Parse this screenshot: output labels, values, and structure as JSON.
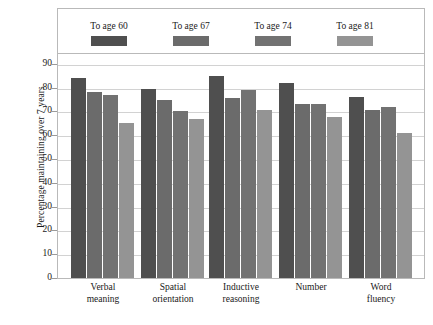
{
  "chart_data": {
    "type": "bar",
    "title": "",
    "xlabel": "",
    "ylabel": "Percentage maintaining over 7 years",
    "ylim": [
      0,
      95
    ],
    "ytick_max_label": 90,
    "yticks": [
      0,
      10,
      20,
      30,
      40,
      50,
      60,
      70,
      80,
      90
    ],
    "grid": true,
    "legend_position": "top-inside",
    "categories": [
      "Verbal\nmeaning",
      "Spatial\norientation",
      "Inductive\nreasoning",
      "Number",
      "Word\nfluency"
    ],
    "category_lines": [
      [
        "Verbal",
        "meaning"
      ],
      [
        "Spatial",
        "orientation"
      ],
      [
        "Inductive",
        "reasoning"
      ],
      [
        "Number",
        ""
      ],
      [
        "Word",
        "fluency"
      ]
    ],
    "series": [
      {
        "name": "To age 60",
        "color": "#4f4f4f",
        "values": [
          84,
          79.5,
          85,
          82,
          76
        ]
      },
      {
        "name": "To age 67",
        "color": "#6b6b6b",
        "values": [
          78,
          75,
          75.5,
          73,
          70.5
        ]
      },
      {
        "name": "To age 74",
        "color": "#727272",
        "values": [
          77,
          70,
          79,
          73,
          72
        ]
      },
      {
        "name": "To age 81",
        "color": "#949494",
        "values": [
          65,
          67,
          70.5,
          67.5,
          61
        ]
      }
    ]
  },
  "ytick_labels": [
    "90",
    "80",
    "70",
    "60",
    "50",
    "40",
    "30",
    "20",
    "10",
    "0"
  ],
  "colors": {
    "frame": "#b9b9b9",
    "grid": "#d2d2d2",
    "background": "#ffffff",
    "text": "#1a1a1a"
  }
}
